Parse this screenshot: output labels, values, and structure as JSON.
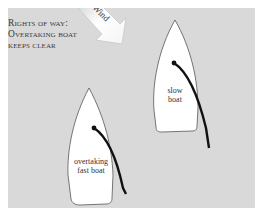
{
  "title": {
    "line1": "Rights of way:",
    "line2": "Overtaking boat",
    "line3": "keeps clear"
  },
  "wind": {
    "label": "Wind",
    "icon": "wind-arrow-icon"
  },
  "boats": [
    {
      "id": "slow",
      "label_line1": "slow",
      "label_line2": "boat"
    },
    {
      "id": "fast",
      "label_line1": "overtaking",
      "label_line2": "fast boat"
    }
  ],
  "colors": {
    "background": "#d9d9d9",
    "boat_fill": "#ffffff",
    "sail": "#111111",
    "arrow": "#f2f2f2"
  }
}
